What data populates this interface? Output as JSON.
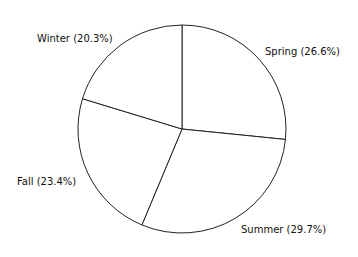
{
  "chart_data": {
    "type": "pie",
    "title": "",
    "categories": [
      "Spring",
      "Summer",
      "Fall",
      "Winter"
    ],
    "values": [
      26.6,
      29.7,
      23.4,
      20.3
    ],
    "unit": "%",
    "labels": [
      "Spring (26.6%)",
      "Summer (29.7%)",
      "Fall (23.4%)",
      "Winter (20.3%)"
    ],
    "start_angle": "12 o'clock",
    "direction": "clockwise",
    "fill_color": "#ffffff",
    "stroke_color": "#222222",
    "legend": "none"
  }
}
